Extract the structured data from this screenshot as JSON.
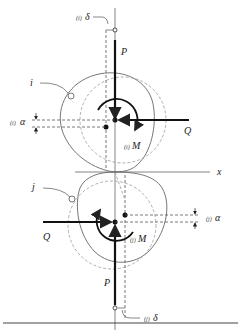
{
  "figure": {
    "type": "mechanics-diagram",
    "colors": {
      "stroke": "#222222",
      "dashed": "#888888",
      "outline": "#666666",
      "background": "#ffffff"
    }
  },
  "labels": {
    "top_delta_prefix": "(i)",
    "top_delta": "δ",
    "top_P": "P",
    "body_i": "i",
    "top_alpha_prefix": "(i)",
    "top_alpha": "α",
    "top_Q": "Q",
    "top_M_prefix": "(i)",
    "top_M": "M",
    "axis_x": "x",
    "body_j": "j",
    "bottom_alpha_prefix": "(j)",
    "bottom_alpha": "α",
    "bottom_Q": "Q",
    "bottom_M_prefix": "(j)",
    "bottom_M": "M",
    "bottom_P": "P",
    "bottom_delta_prefix": "(j)",
    "bottom_delta": "δ"
  }
}
